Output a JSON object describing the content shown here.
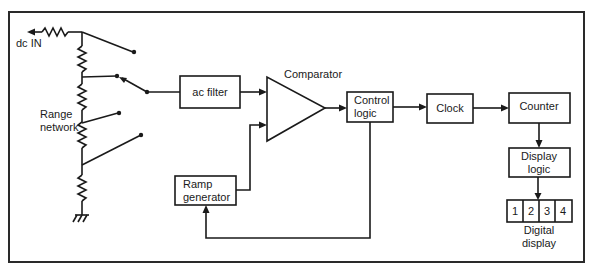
{
  "diagram": {
    "input_label": "dc IN",
    "range_network": {
      "line1": "Range",
      "line2": "network"
    },
    "blocks": {
      "ac_filter": {
        "label": "ac filter"
      },
      "comparator": {
        "label": "Comparator"
      },
      "control_logic": {
        "line1": "Control",
        "line2": "logic"
      },
      "clock": {
        "label": "Clock"
      },
      "counter": {
        "label": "Counter"
      },
      "display_logic": {
        "line1": "Display",
        "line2": "logic"
      },
      "ramp_generator": {
        "line1": "Ramp",
        "line2": "generator"
      },
      "digital_display": {
        "digits": [
          "1",
          "2",
          "3",
          "4"
        ],
        "line1": "Digital",
        "line2": "display"
      }
    },
    "connections": [
      {
        "from": "dc IN",
        "to": "Range network"
      },
      {
        "from": "Range network",
        "to": "ac filter",
        "via": "range switch"
      },
      {
        "from": "ac filter",
        "to": "Comparator"
      },
      {
        "from": "Ramp generator",
        "to": "Comparator"
      },
      {
        "from": "Comparator",
        "to": "Control logic"
      },
      {
        "from": "Control logic",
        "to": "Clock"
      },
      {
        "from": "Clock",
        "to": "Counter"
      },
      {
        "from": "Counter",
        "to": "Display logic"
      },
      {
        "from": "Display logic",
        "to": "Digital display"
      },
      {
        "from": "Control logic",
        "to": "Ramp generator"
      }
    ]
  }
}
